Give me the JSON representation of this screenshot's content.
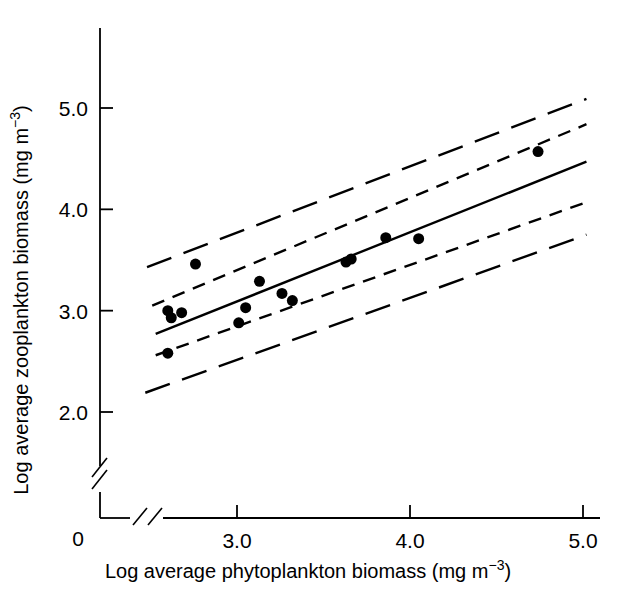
{
  "chart_data": {
    "type": "scatter",
    "title": "",
    "xlabel": "Log average phytoplankton biomass (mg m⁻³)",
    "ylabel": "Log average zooplankton biomass (mg m⁻³)",
    "xlabel_parts": {
      "main": "Log average phytoplankton biomass (mg m",
      "exponent": "−3",
      "tail": ")"
    },
    "ylabel_parts": {
      "main": "Log average zooplankton biomass (mg m",
      "exponent": "−3",
      "tail": ")"
    },
    "x_ticks": [
      "3.0",
      "4.0",
      "5.0"
    ],
    "x_tick_values": [
      3.0,
      4.0,
      5.0
    ],
    "y_ticks": [
      "2.0",
      "3.0",
      "4.0",
      "5.0"
    ],
    "y_tick_values": [
      2.0,
      3.0,
      4.0,
      5.0
    ],
    "origin_label": "0",
    "xlim": [
      2.45,
      5.1
    ],
    "ylim": [
      1.85,
      5.5
    ],
    "grid": false,
    "legend": null,
    "axis_breaks": {
      "x_axis": true,
      "y_axis": true,
      "note": "double slash break marks near origin on both axes"
    },
    "marker": {
      "shape": "circle",
      "color": "#000000",
      "size_px": 11
    },
    "points": [
      {
        "x": 2.6,
        "y": 2.58
      },
      {
        "x": 2.6,
        "y": 3.0
      },
      {
        "x": 2.62,
        "y": 2.93
      },
      {
        "x": 2.68,
        "y": 2.98
      },
      {
        "x": 2.76,
        "y": 3.46
      },
      {
        "x": 3.01,
        "y": 2.88
      },
      {
        "x": 3.05,
        "y": 3.03
      },
      {
        "x": 3.13,
        "y": 3.29
      },
      {
        "x": 3.26,
        "y": 3.17
      },
      {
        "x": 3.32,
        "y": 3.1
      },
      {
        "x": 3.63,
        "y": 3.48
      },
      {
        "x": 3.66,
        "y": 3.51
      },
      {
        "x": 3.86,
        "y": 3.72
      },
      {
        "x": 4.05,
        "y": 3.71
      },
      {
        "x": 4.74,
        "y": 4.57
      }
    ],
    "series": [
      {
        "name": "regression line",
        "style": "solid",
        "x": [
          2.53,
          5.02
        ],
        "y": [
          2.77,
          4.47
        ]
      },
      {
        "name": "upper confidence band",
        "style": "short-dash",
        "x": [
          2.51,
          5.02
        ],
        "y": [
          3.05,
          4.84
        ]
      },
      {
        "name": "lower confidence band",
        "style": "short-dash",
        "x": [
          2.53,
          5.02
        ],
        "y": [
          2.56,
          4.07
        ]
      },
      {
        "name": "upper prediction band",
        "style": "long-dash",
        "x": [
          2.48,
          5.02
        ],
        "y": [
          3.43,
          5.09
        ]
      },
      {
        "name": "lower prediction band",
        "style": "long-dash",
        "x": [
          2.47,
          5.02
        ],
        "y": [
          2.19,
          3.75
        ]
      }
    ]
  }
}
